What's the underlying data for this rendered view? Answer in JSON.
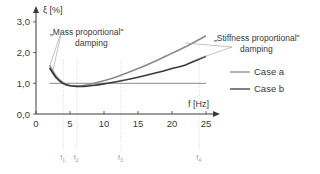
{
  "chart_data": {
    "type": "line",
    "title": "",
    "xlabel": "f [Hz]",
    "ylabel": "ξ [%]",
    "xlim": [
      0,
      26
    ],
    "ylim": [
      0,
      3.2
    ],
    "x_ticks": [
      0,
      5,
      10,
      15,
      20,
      25
    ],
    "x_tick_labels": [
      "0",
      "5",
      "10",
      "15",
      "20",
      "25"
    ],
    "y_ticks": [
      0,
      1,
      2,
      3
    ],
    "y_tick_labels": [
      "0,0",
      "1,0",
      "2,0",
      "3,0"
    ],
    "grid": false,
    "legend": "right",
    "reference_line": {
      "y": 1.0,
      "x_range": [
        2,
        25
      ]
    },
    "series": [
      {
        "name": "Case a",
        "color": "#8a8a8a",
        "x": [
          2,
          3,
          4,
          5,
          6,
          7,
          8,
          10,
          12,
          15,
          18,
          20,
          22,
          25
        ],
        "y": [
          1.58,
          1.22,
          1.02,
          0.93,
          0.91,
          0.93,
          0.97,
          1.08,
          1.22,
          1.48,
          1.77,
          1.98,
          2.19,
          2.55
        ]
      },
      {
        "name": "Case b",
        "color": "#3a3a3a",
        "x": [
          2,
          3,
          4,
          5,
          6,
          7,
          8,
          10,
          12,
          15,
          18,
          20,
          22,
          25
        ],
        "y": [
          1.5,
          1.17,
          0.99,
          0.92,
          0.9,
          0.9,
          0.92,
          0.98,
          1.06,
          1.2,
          1.36,
          1.48,
          1.6,
          1.88
        ]
      }
    ],
    "markers": [
      {
        "label": "f",
        "sub": "1",
        "x": 4
      },
      {
        "label": "f",
        "sub": "2",
        "x": 6
      },
      {
        "label": "f",
        "sub": "3",
        "x": 12.5
      },
      {
        "label": "f",
        "sub": "4",
        "x": 24
      }
    ],
    "annotations": [
      {
        "lines": [
          "„Mass proportional\"",
          "damping"
        ],
        "points_to": "low-frequency branch"
      },
      {
        "lines": [
          "„Stiffness proportional\"",
          "damping"
        ],
        "points_to": "high-frequency branch"
      }
    ]
  }
}
